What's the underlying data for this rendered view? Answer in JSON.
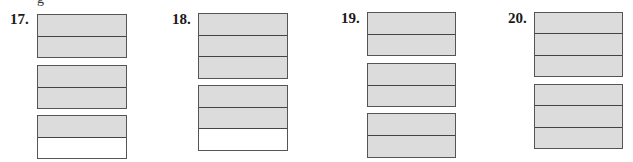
{
  "cutoff_text": "g",
  "colors": {
    "shaded": "#dcdcdc",
    "blank": "#ffffff",
    "border": "#444444"
  },
  "problems": [
    {
      "label": "17.",
      "label_pos": [
        10,
        12
      ],
      "strips": [
        {
          "x": 37,
          "y": 14,
          "w": 90,
          "h": 44,
          "cells": [
            "shaded",
            "shaded"
          ]
        },
        {
          "x": 37,
          "y": 65,
          "w": 90,
          "h": 44,
          "cells": [
            "shaded",
            "shaded"
          ]
        },
        {
          "x": 37,
          "y": 115,
          "w": 90,
          "h": 44,
          "cells": [
            "shaded",
            "blank"
          ]
        }
      ]
    },
    {
      "label": "18.",
      "label_pos": [
        172,
        12
      ],
      "strips": [
        {
          "x": 198,
          "y": 13,
          "w": 90,
          "h": 66,
          "cells": [
            "shaded",
            "shaded",
            "shaded"
          ]
        },
        {
          "x": 198,
          "y": 85,
          "w": 90,
          "h": 66,
          "cells": [
            "shaded",
            "shaded",
            "blank"
          ]
        }
      ]
    },
    {
      "label": "19.",
      "label_pos": [
        341,
        11
      ],
      "strips": [
        {
          "x": 367,
          "y": 12,
          "w": 89,
          "h": 44,
          "cells": [
            "shaded",
            "shaded"
          ]
        },
        {
          "x": 367,
          "y": 63,
          "w": 89,
          "h": 44,
          "cells": [
            "shaded",
            "shaded"
          ]
        },
        {
          "x": 367,
          "y": 113,
          "w": 89,
          "h": 45,
          "cells": [
            "shaded",
            "shaded"
          ]
        }
      ]
    },
    {
      "label": "20.",
      "label_pos": [
        508,
        11
      ],
      "strips": [
        {
          "x": 534,
          "y": 12,
          "w": 89,
          "h": 65,
          "cells": [
            "shaded",
            "shaded",
            "shaded"
          ]
        },
        {
          "x": 534,
          "y": 84,
          "w": 89,
          "h": 65,
          "cells": [
            "shaded",
            "shaded",
            "shaded"
          ]
        }
      ]
    }
  ]
}
